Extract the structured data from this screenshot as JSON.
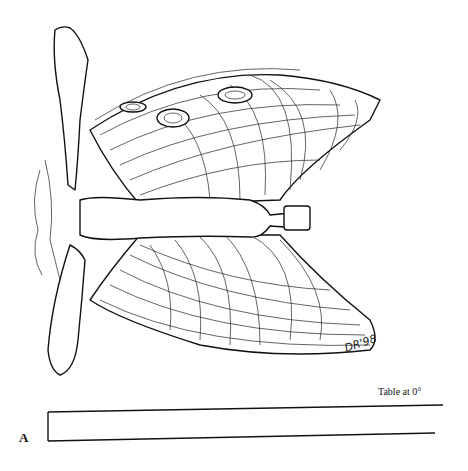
{
  "figure": {
    "panel_label": "A",
    "table_label": "Table at 0°",
    "signature": "DR'98",
    "colors": {
      "line": "#111111",
      "background": "#ffffff"
    }
  }
}
